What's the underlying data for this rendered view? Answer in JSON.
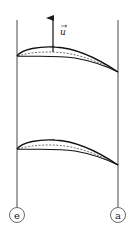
{
  "diagram": {
    "type": "blade-cascade",
    "velocity_vector": {
      "label": "u",
      "direction": "up"
    },
    "blades": [
      {
        "name": "upper-blade"
      },
      {
        "name": "lower-blade"
      }
    ],
    "boundaries": [
      {
        "label": "e",
        "side": "left"
      },
      {
        "label": "a",
        "side": "right"
      }
    ],
    "colors": {
      "line": "#1a1a1a",
      "background": "#ffffff"
    }
  }
}
